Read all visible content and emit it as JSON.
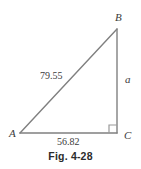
{
  "figure": {
    "caption": "Fig. 4-28",
    "type": "right-triangle-diagram",
    "line_color": "#808080",
    "text_color": "#3b3b3b",
    "caption_color": "#2b2b2b",
    "background": "#ffffff"
  },
  "vertices": [
    {
      "label": "B",
      "x": 117,
      "y": 29
    },
    {
      "label": "A",
      "x": 20,
      "y": 133
    },
    {
      "label": "C",
      "x": 117,
      "y": 133
    }
  ],
  "vertex_labels": {
    "B": "B",
    "A": "A",
    "C": "C"
  },
  "sides": {
    "hypotenuse_label": "79.55",
    "base_label": "56.82",
    "vertical_label": "a"
  },
  "right_angle": {
    "at_vertex": "C",
    "marker": "square"
  }
}
